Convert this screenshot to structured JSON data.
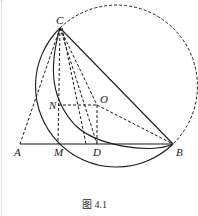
{
  "figure": {
    "caption": "图 4.1",
    "points": {
      "C": {
        "label": "C",
        "x": 60,
        "y": 28
      },
      "N": {
        "label": "N",
        "x": 58,
        "y": 105
      },
      "O": {
        "label": "O",
        "x": 97,
        "y": 105
      },
      "A": {
        "label": "A",
        "x": 20,
        "y": 144
      },
      "M": {
        "label": "M",
        "x": 58,
        "y": 144
      },
      "D": {
        "label": "D",
        "x": 97,
        "y": 144
      },
      "B": {
        "label": "B",
        "x": 173,
        "y": 144
      }
    },
    "solid_segments": [
      "AB",
      "CB"
    ],
    "dashed_segments": [
      "CA",
      "CM",
      "CD",
      "CO",
      "NO",
      "OD",
      "OB"
    ],
    "arcs": [
      {
        "name": "solid-circle",
        "style": "solid",
        "through": [
          "C",
          "A",
          "B"
        ]
      },
      {
        "name": "dashed-circle",
        "style": "dashed",
        "through": [
          "C",
          "B"
        ]
      },
      {
        "name": "arc-CNDB",
        "style": "solid",
        "through": [
          "C",
          "N",
          "D",
          "B"
        ]
      }
    ]
  }
}
